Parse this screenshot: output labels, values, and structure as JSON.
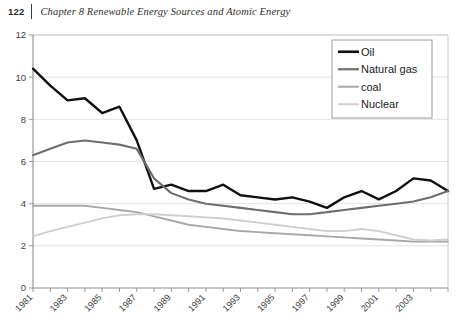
{
  "header": {
    "page_number": "122",
    "chapter_title": "Chapter 8  Renewable Energy Sources and Atomic Energy"
  },
  "footer": {
    "caption_partial": ""
  },
  "colors": {
    "oil": "#101010",
    "natural_gas": "#6e6e6e",
    "coal": "#a8a8a8",
    "nuclear": "#cfcfcf",
    "gridline": "#e2e2e2",
    "axis": "#8e8e8e",
    "text": "#3d3d3d",
    "legend_border": "#9b9b9b",
    "background": "#ffffff"
  },
  "chart_data": {
    "type": "line",
    "title": "",
    "xlabel": "",
    "ylabel": "",
    "xlim": [
      1981,
      2005
    ],
    "ylim": [
      0,
      12
    ],
    "yticks": [
      0,
      2,
      4,
      6,
      8,
      10,
      12
    ],
    "ytick_labels": [
      "0",
      "2",
      "4",
      "6",
      "8",
      "10",
      "12"
    ],
    "grid": true,
    "grid_axis": "y",
    "legend_position": "top-right",
    "x": [
      1981,
      1982,
      1983,
      1984,
      1985,
      1986,
      1987,
      1988,
      1989,
      1990,
      1991,
      1992,
      1993,
      1994,
      1995,
      1996,
      1997,
      1998,
      1999,
      2000,
      2001,
      2002,
      2003,
      2004,
      2005
    ],
    "xticks": [
      1981,
      1982,
      1983,
      1984,
      1985,
      1986,
      1987,
      1988,
      1989,
      1990,
      1991,
      1992,
      1993,
      1994,
      1995,
      1996,
      1997,
      1998,
      1999,
      2000,
      2001,
      2002,
      2003,
      2004,
      2005
    ],
    "xtick_labels": [
      "1981",
      "",
      "1983",
      "",
      "1985",
      "",
      "1987",
      "",
      "1989",
      "",
      "1991",
      "",
      "1993",
      "",
      "1995",
      "",
      "1997",
      "",
      "1999",
      "",
      "2001",
      "",
      "2003",
      "",
      ""
    ],
    "series": [
      {
        "name": "Oil",
        "color": "#101010",
        "width": 2.4,
        "values": [
          10.4,
          9.6,
          8.9,
          9.0,
          8.3,
          8.6,
          7.0,
          4.7,
          4.9,
          4.6,
          4.6,
          4.9,
          4.4,
          4.3,
          4.2,
          4.3,
          4.1,
          3.8,
          4.3,
          4.6,
          4.2,
          4.6,
          5.2,
          5.1,
          4.6
        ]
      },
      {
        "name": "Natural gas",
        "color": "#6e6e6e",
        "width": 2.1,
        "values": [
          6.3,
          6.6,
          6.9,
          7.0,
          6.9,
          6.8,
          6.6,
          5.2,
          4.5,
          4.2,
          4.0,
          3.9,
          3.8,
          3.7,
          3.6,
          3.5,
          3.5,
          3.6,
          3.7,
          3.8,
          3.9,
          4.0,
          4.1,
          4.3,
          4.6
        ]
      },
      {
        "name": "coal",
        "color": "#a8a8a8",
        "width": 1.9,
        "values": [
          3.9,
          3.9,
          3.9,
          3.9,
          3.8,
          3.7,
          3.6,
          3.4,
          3.2,
          3.0,
          2.9,
          2.8,
          2.7,
          2.65,
          2.6,
          2.55,
          2.5,
          2.45,
          2.4,
          2.35,
          2.3,
          2.25,
          2.2,
          2.2,
          2.2
        ]
      },
      {
        "name": "Nuclear",
        "color": "#cfcfcf",
        "width": 1.9,
        "values": [
          2.45,
          2.7,
          2.9,
          3.1,
          3.3,
          3.45,
          3.5,
          3.5,
          3.45,
          3.4,
          3.35,
          3.3,
          3.2,
          3.1,
          3.0,
          2.9,
          2.8,
          2.7,
          2.7,
          2.8,
          2.7,
          2.5,
          2.3,
          2.25,
          2.3
        ]
      }
    ],
    "legend": [
      {
        "label": "Oil",
        "color": "#101010",
        "width": 2.6
      },
      {
        "label": "Natural gas",
        "color": "#6e6e6e",
        "width": 2.2
      },
      {
        "label": "coal",
        "color": "#a8a8a8",
        "width": 2.0
      },
      {
        "label": "Nuclear",
        "color": "#cfcfcf",
        "width": 2.0
      }
    ]
  },
  "plot_geometry": {
    "left": 33,
    "right": 448,
    "top": 13,
    "bottom": 266
  }
}
